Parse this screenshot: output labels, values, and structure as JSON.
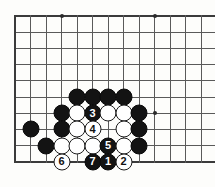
{
  "diagram": {
    "type": "go-board",
    "board": {
      "background_color": "#fdfdfb",
      "line_color": "#5a5a5a",
      "edge_color": "#3b3b3b",
      "black_stone_color": "#131313",
      "white_stone_color": "#ffffff",
      "origin_x": 15,
      "origin_y": 16,
      "spacing_x": 15.5,
      "spacing_y": 16.2,
      "cols": 13,
      "rows": 10,
      "edges": {
        "top": true,
        "left": true,
        "bottom": true,
        "right": false
      },
      "star_points": [
        {
          "col": 3,
          "row": 0
        },
        {
          "col": 9,
          "row": 0
        },
        {
          "col": 9,
          "row": 6
        }
      ]
    },
    "stones": [
      {
        "col": 4,
        "row": 5,
        "color": "black",
        "label": ""
      },
      {
        "col": 5,
        "row": 5,
        "color": "black",
        "label": ""
      },
      {
        "col": 6,
        "row": 5,
        "color": "black",
        "label": ""
      },
      {
        "col": 7,
        "row": 5,
        "color": "black",
        "label": ""
      },
      {
        "col": 3,
        "row": 6,
        "color": "black",
        "label": ""
      },
      {
        "col": 4,
        "row": 6,
        "color": "white",
        "label": ""
      },
      {
        "col": 5,
        "row": 6,
        "color": "black",
        "label": "3"
      },
      {
        "col": 6,
        "row": 6,
        "color": "white",
        "label": ""
      },
      {
        "col": 7,
        "row": 6,
        "color": "white",
        "label": ""
      },
      {
        "col": 8,
        "row": 6,
        "color": "black",
        "label": ""
      },
      {
        "col": 1,
        "row": 7,
        "color": "black",
        "label": ""
      },
      {
        "col": 3,
        "row": 7,
        "color": "black",
        "label": ""
      },
      {
        "col": 4,
        "row": 7,
        "color": "white",
        "label": ""
      },
      {
        "col": 5,
        "row": 7,
        "color": "white",
        "label": "4"
      },
      {
        "col": 7,
        "row": 7,
        "color": "white",
        "label": ""
      },
      {
        "col": 8,
        "row": 7,
        "color": "black",
        "label": ""
      },
      {
        "col": 2,
        "row": 8,
        "color": "black",
        "label": ""
      },
      {
        "col": 3,
        "row": 8,
        "color": "white",
        "label": ""
      },
      {
        "col": 4,
        "row": 8,
        "color": "white",
        "label": ""
      },
      {
        "col": 5,
        "row": 8,
        "color": "white",
        "label": ""
      },
      {
        "col": 6,
        "row": 8,
        "color": "black",
        "label": "5"
      },
      {
        "col": 7,
        "row": 8,
        "color": "white",
        "label": ""
      },
      {
        "col": 8,
        "row": 8,
        "color": "black",
        "label": ""
      },
      {
        "col": 3,
        "row": 9,
        "color": "white",
        "label": "6"
      },
      {
        "col": 5,
        "row": 9,
        "color": "black",
        "label": "7"
      },
      {
        "col": 6,
        "row": 9,
        "color": "black",
        "label": "1"
      },
      {
        "col": 7,
        "row": 9,
        "color": "white",
        "label": "2"
      }
    ],
    "move_sequence": [
      {
        "number": "1",
        "color": "black"
      },
      {
        "number": "2",
        "color": "white"
      },
      {
        "number": "3",
        "color": "black"
      },
      {
        "number": "4",
        "color": "white"
      },
      {
        "number": "5",
        "color": "black"
      },
      {
        "number": "6",
        "color": "white"
      },
      {
        "number": "7",
        "color": "black"
      }
    ]
  }
}
